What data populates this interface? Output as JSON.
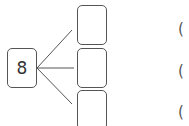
{
  "diagram": {
    "root": {
      "label": "8"
    },
    "branches": [
      {
        "value": ""
      },
      {
        "value": ""
      },
      {
        "value": ""
      }
    ],
    "answer_parens": [
      "(",
      "(",
      "("
    ]
  }
}
